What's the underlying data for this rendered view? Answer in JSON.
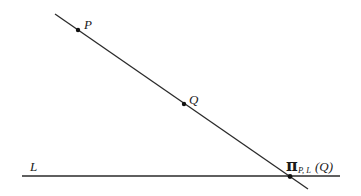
{
  "diagram": {
    "type": "geometry-projection",
    "colors": {
      "stroke": "#2a2a2a",
      "background": "#ffffff"
    },
    "lines": [
      {
        "id": "PQ-line",
        "from": [
          55,
          14
        ],
        "to": [
          308,
          189
        ]
      },
      {
        "id": "L",
        "from": [
          22,
          176
        ],
        "to": [
          340,
          176
        ]
      }
    ],
    "points": [
      {
        "id": "P",
        "x": 78,
        "y": 30
      },
      {
        "id": "Q",
        "x": 184,
        "y": 104
      },
      {
        "id": "projection",
        "x": 290,
        "y": 176
      }
    ],
    "labels": {
      "P": "P",
      "Q": "Q",
      "L": "L",
      "pi_symbol": "π",
      "pi_subscript": "P, L",
      "pi_argument": "(Q)"
    }
  }
}
